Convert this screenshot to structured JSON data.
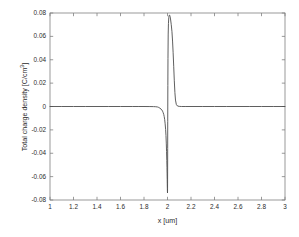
{
  "chart_data": {
    "type": "line",
    "title": "",
    "xlabel": "x [um]",
    "ylabel_text": "Total charge density [C/cm",
    "ylabel_sup": "3",
    "ylabel_tail": "]",
    "ylabel_full": "Total charge density [C/cm3]",
    "xlim": [
      1,
      3
    ],
    "ylim": [
      -0.08,
      0.08
    ],
    "grid": false,
    "legend": null,
    "box": true,
    "line_color": "#4d4d4d",
    "axis_color": "#808080",
    "background": "#ffffff",
    "xticks": [
      1,
      1.2,
      1.4,
      1.6,
      1.8,
      2,
      2.2,
      2.4,
      2.6,
      2.8,
      3
    ],
    "xtick_labels": [
      "1",
      "1.2",
      "1.4",
      "1.6",
      "1.8",
      "2",
      "2.2",
      "2.4",
      "2.6",
      "2.8",
      "3"
    ],
    "yticks": [
      0.08,
      0.06,
      0.04,
      0.02,
      0,
      -0.02,
      -0.04,
      -0.06,
      -0.08
    ],
    "ytick_labels": [
      "0.08",
      "0.06",
      "0.04",
      "0.02",
      "0",
      "-0.02",
      "-0.04",
      "-0.06",
      "-0.08"
    ],
    "series": [
      {
        "name": "Total charge density",
        "x": [
          1.0,
          1.1,
          1.2,
          1.3,
          1.4,
          1.5,
          1.6,
          1.7,
          1.75,
          1.8,
          1.85,
          1.88,
          1.9,
          1.915,
          1.925,
          1.935,
          1.945,
          1.952,
          1.958,
          1.963,
          1.968,
          1.972,
          1.976,
          1.98,
          1.984,
          1.987,
          1.99,
          1.992,
          1.994,
          1.9955,
          1.9965,
          1.9975,
          1.998,
          1.9985,
          1.999,
          1.9995,
          2.0,
          2.0005,
          2.001,
          2.0015,
          2.002,
          2.003,
          2.004,
          2.006,
          2.008,
          2.011,
          2.014,
          2.018,
          2.022,
          2.027,
          2.032,
          2.038,
          2.043,
          2.048,
          2.053,
          2.058,
          2.063,
          2.068,
          2.075,
          2.085,
          2.1,
          2.12,
          2.15,
          2.2,
          2.3,
          2.4,
          2.5,
          2.6,
          2.7,
          2.8,
          2.9,
          3.0
        ],
        "y": [
          0.0,
          0.0,
          0.0,
          0.0,
          0.0,
          0.0,
          0.0,
          0.0,
          0.0,
          0.0,
          -5e-05,
          -0.0001,
          -0.0002,
          -0.0004,
          -0.0008,
          -0.0014,
          -0.0022,
          -0.003,
          -0.004,
          -0.0052,
          -0.0068,
          -0.0086,
          -0.0112,
          -0.0148,
          -0.0196,
          -0.0248,
          -0.032,
          -0.0386,
          -0.0462,
          -0.052,
          -0.057,
          -0.0625,
          -0.066,
          -0.069,
          -0.0714,
          -0.0732,
          -0.074,
          -0.07,
          -0.056,
          -0.036,
          -0.013,
          0.018,
          0.041,
          0.062,
          0.071,
          0.0762,
          0.078,
          0.0782,
          0.077,
          0.074,
          0.07,
          0.064,
          0.056,
          0.046,
          0.034,
          0.022,
          0.012,
          0.0055,
          0.0018,
          0.0004,
          0.0001,
          0.0,
          0.0,
          0.0,
          0.0,
          0.0,
          0.0,
          0.0,
          0.0,
          0.0,
          0.0,
          0.0
        ]
      }
    ]
  },
  "axes_geometry": {
    "left": 50,
    "right": 285,
    "top": 13,
    "bottom": 200
  }
}
